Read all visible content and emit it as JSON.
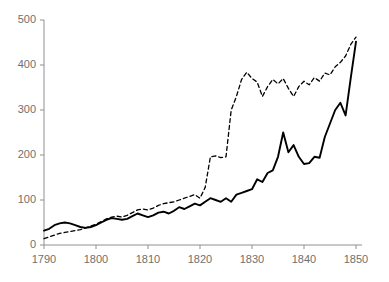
{
  "chart_data": {
    "type": "line",
    "title": "",
    "subtitle": "",
    "xlabel": "",
    "ylabel": "",
    "xlim": [
      1790,
      1850
    ],
    "ylim": [
      0,
      500
    ],
    "xticks": [
      1790,
      1800,
      1810,
      1820,
      1830,
      1840,
      1850
    ],
    "yticks": [
      0,
      100,
      200,
      300,
      400,
      500
    ],
    "grid": false,
    "legend": "none",
    "axis_color": "#808080",
    "line_color": "#000000",
    "x": [
      1790,
      1791,
      1792,
      1793,
      1794,
      1795,
      1796,
      1797,
      1798,
      1799,
      1800,
      1801,
      1802,
      1803,
      1804,
      1805,
      1806,
      1807,
      1808,
      1809,
      1810,
      1811,
      1812,
      1813,
      1814,
      1815,
      1816,
      1817,
      1818,
      1819,
      1820,
      1821,
      1822,
      1823,
      1824,
      1825,
      1826,
      1827,
      1828,
      1829,
      1830,
      1831,
      1832,
      1833,
      1834,
      1835,
      1836,
      1837,
      1838,
      1839,
      1840,
      1841,
      1842,
      1843,
      1844,
      1845,
      1846,
      1847,
      1848,
      1849,
      1850
    ],
    "series": [
      {
        "name": "solid-series",
        "style": "solid",
        "color": "#000000",
        "values": [
          32,
          36,
          44,
          48,
          50,
          48,
          44,
          40,
          38,
          40,
          44,
          50,
          56,
          60,
          58,
          56,
          58,
          64,
          70,
          66,
          62,
          66,
          72,
          74,
          70,
          76,
          84,
          80,
          86,
          92,
          88,
          96,
          104,
          100,
          96,
          104,
          96,
          112,
          116,
          120,
          124,
          146,
          140,
          160,
          166,
          196,
          250,
          206,
          222,
          196,
          180,
          182,
          196,
          194,
          240,
          270,
          300,
          316,
          288,
          372,
          452
        ]
      },
      {
        "name": "dashed-series",
        "style": "dashed",
        "color": "#000000",
        "values": [
          14,
          18,
          22,
          26,
          28,
          30,
          32,
          34,
          38,
          42,
          46,
          52,
          58,
          62,
          64,
          62,
          66,
          72,
          78,
          80,
          78,
          82,
          88,
          92,
          94,
          96,
          100,
          104,
          108,
          112,
          104,
          128,
          196,
          198,
          194,
          196,
          300,
          330,
          368,
          384,
          370,
          362,
          330,
          352,
          368,
          358,
          370,
          348,
          330,
          352,
          364,
          356,
          372,
          364,
          382,
          378,
          396,
          406,
          420,
          446,
          462
        ]
      }
    ]
  },
  "axes": {
    "y_tick_labels": [
      "500",
      "400",
      "300",
      "200",
      "100",
      "0"
    ],
    "x_tick_labels": [
      "1790",
      "1800",
      "1810",
      "1820",
      "1830",
      "1840",
      "1850"
    ]
  }
}
